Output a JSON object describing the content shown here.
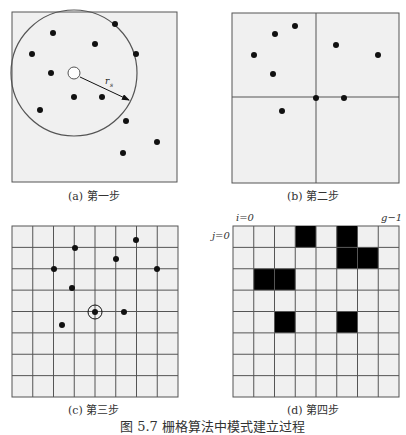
{
  "figure": {
    "caption": "图 5.7   栅格算法中模式建立过程",
    "panels": [
      {
        "id": "a",
        "caption": "(a) 第一步",
        "box": [
          12,
          12,
          165,
          170
        ],
        "circle": {
          "cx": 74,
          "cy": 73,
          "r": 63
        },
        "center_marker": {
          "cx": 74,
          "cy": 73,
          "r": 6
        },
        "radius_label": "rs",
        "radius_arrow": {
          "x1": 80,
          "y1": 77,
          "x2": 129,
          "y2": 100
        },
        "points": [
          [
            115,
            24
          ],
          [
            53,
            33
          ],
          [
            95,
            44
          ],
          [
            32,
            54
          ],
          [
            136,
            54
          ],
          [
            51,
            73
          ],
          [
            74,
            97
          ],
          [
            102,
            97
          ],
          [
            40,
            110
          ],
          [
            126,
            121
          ],
          [
            157,
            142
          ],
          [
            123,
            153
          ]
        ]
      },
      {
        "id": "b",
        "caption": "(b) 第二步",
        "box": [
          232,
          13,
          167,
          170
        ],
        "divider": {
          "x": 316,
          "y": 97
        },
        "points": [
          [
            295,
            26
          ],
          [
            275,
            34
          ],
          [
            336,
            45
          ],
          [
            254,
            55
          ],
          [
            378,
            55
          ],
          [
            273,
            74
          ],
          [
            316,
            98
          ],
          [
            344,
            98
          ],
          [
            282,
            111
          ]
        ]
      },
      {
        "id": "c",
        "caption": "(c) 第三步",
        "box": [
          12,
          226,
          166,
          171
        ],
        "grid": {
          "cols": 8,
          "rows": 8
        },
        "highlight": {
          "cx": 95,
          "cy": 312,
          "r": 7
        },
        "points": [
          [
            136,
            240
          ],
          [
            75,
            248
          ],
          [
            116,
            259
          ],
          [
            54,
            269
          ],
          [
            157,
            269
          ],
          [
            72,
            288
          ],
          [
            95,
            312
          ],
          [
            124,
            312
          ],
          [
            62,
            325
          ]
        ]
      },
      {
        "id": "d",
        "caption": "(d) 第四步",
        "box": [
          233,
          226,
          166,
          171
        ],
        "grid": {
          "cols": 8,
          "rows": 8
        },
        "label_i": "i=0",
        "label_j": "j=0",
        "label_g": "g−1",
        "filled_cells": [
          [
            3,
            0
          ],
          [
            5,
            0
          ],
          [
            5,
            1
          ],
          [
            6,
            1
          ],
          [
            1,
            2
          ],
          [
            2,
            2
          ],
          [
            2,
            4
          ],
          [
            5,
            4
          ]
        ]
      }
    ]
  },
  "colors": {
    "panel_fill": "#f0f0f0",
    "line": "#555555",
    "dot": "#111111",
    "filled_cell": "#000000"
  }
}
